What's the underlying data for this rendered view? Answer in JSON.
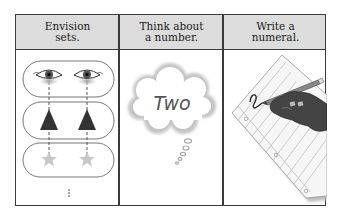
{
  "columns": [
    {
      "label": "Envision\nsets.",
      "illustration": "eyes-triangles-stars-sets"
    },
    {
      "label": "Think about\na number.",
      "illustration": "thought-cloud"
    },
    {
      "label": "Write a\nnumeral.",
      "illustration": "hand-writing-on-paper"
    }
  ],
  "cloud": {
    "word": "Two"
  },
  "sets": {
    "rows": [
      "eyes",
      "triangles",
      "stars"
    ],
    "continuation": "⋮"
  },
  "colors": {
    "header_bg": "#dcdcdc",
    "border": "#3a3a3a",
    "triangle": "#333333",
    "star": "#c8c8c8"
  }
}
